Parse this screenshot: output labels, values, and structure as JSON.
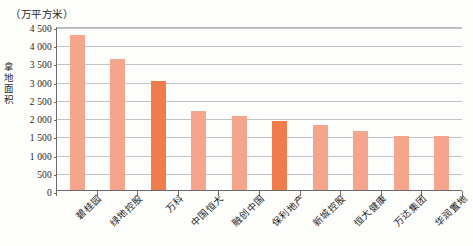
{
  "chart_data": {
    "type": "bar",
    "title": "",
    "subtitle": "",
    "unit_caption": "（万平方米）",
    "xlabel": "",
    "ylabel": "拿地面积",
    "ylim": [
      0,
      4500
    ],
    "ytick_step": 500,
    "grid": true,
    "legend": "none",
    "categories": [
      "碧桂园",
      "绿地控股",
      "万科",
      "中国恒大",
      "融创中国",
      "保利地产",
      "新城控股",
      "恒大健康",
      "万达集团",
      "华润置地"
    ],
    "values": [
      4250,
      3590,
      2990,
      2170,
      2040,
      1890,
      1780,
      1620,
      1480,
      1470
    ],
    "ytick_labels": [
      "0",
      "500",
      "1 000",
      "1 500",
      "2 000",
      "2 500",
      "3 000",
      "3 500",
      "4 000",
      "4 500"
    ],
    "ytick_values": [
      0,
      500,
      1000,
      1500,
      2000,
      2500,
      3000,
      3500,
      4000,
      4500
    ],
    "bar_colors": [
      "#f4a58c",
      "#f4a58c",
      "#f07c4c",
      "#f4a58c",
      "#f4a58c",
      "#f07c4c",
      "#f4a58c",
      "#f4a58c",
      "#f4a58c",
      "#f4a58c"
    ],
    "colors": {
      "bar_default": "#f4a58c",
      "bar_accent": "#f07c4c",
      "gridline": "#c2c2c2",
      "axis": "#6b6b6b",
      "text": "#1c1c1c",
      "background": "#fdfdfb"
    }
  }
}
